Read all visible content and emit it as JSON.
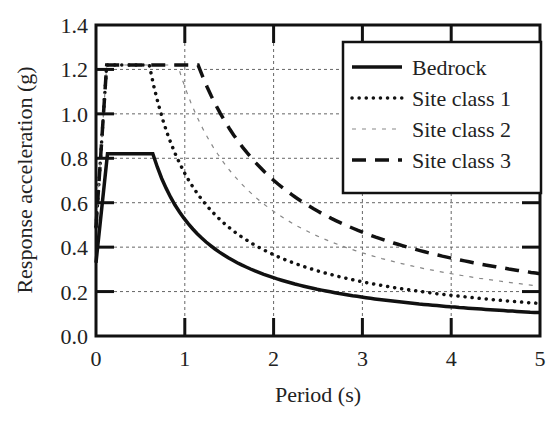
{
  "chart_data": {
    "type": "line",
    "title": "",
    "xlabel": "Period (s)",
    "ylabel": "Response acceleration (g)",
    "xlim": [
      0,
      5
    ],
    "ylim": [
      0,
      1.4
    ],
    "xticks": [
      "0",
      "1",
      "2",
      "3",
      "4",
      "5"
    ],
    "yticks": [
      "0.0",
      "0.2",
      "0.4",
      "0.6",
      "0.8",
      "1.0",
      "1.2",
      "1.4"
    ],
    "grid": true,
    "legend_position": "upper right",
    "series": [
      {
        "name": "Bedrock",
        "style": "solid",
        "T0": 0.0,
        "A0": 0.33,
        "Tb": 0.13,
        "Tc": 0.64,
        "plateau": 0.82
      },
      {
        "name": "Site class 1",
        "style": "dotted",
        "T0": 0.0,
        "A0": 0.49,
        "Tb": 0.12,
        "Tc": 0.6,
        "plateau": 1.22
      },
      {
        "name": "Site class 2",
        "style": "open-circles",
        "T0": 0.0,
        "A0": 0.49,
        "Tb": 0.12,
        "Tc": 0.92,
        "plateau": 1.22
      },
      {
        "name": "Site class 3",
        "style": "dashed",
        "T0": 0.0,
        "A0": 0.49,
        "Tb": 0.12,
        "Tc": 1.15,
        "plateau": 1.22
      }
    ],
    "sample_values": {
      "x": [
        0,
        0.5,
        1,
        2,
        3,
        4,
        5
      ],
      "Bedrock": [
        0.33,
        0.82,
        0.52,
        0.26,
        0.17,
        0.13,
        0.1
      ],
      "Site class 1": [
        0.49,
        1.22,
        0.73,
        0.37,
        0.24,
        0.18,
        0.15
      ],
      "Site class 2": [
        0.49,
        1.22,
        1.12,
        0.56,
        0.37,
        0.28,
        0.22
      ],
      "Site class 3": [
        0.49,
        1.22,
        1.22,
        0.7,
        0.47,
        0.35,
        0.28
      ]
    }
  }
}
